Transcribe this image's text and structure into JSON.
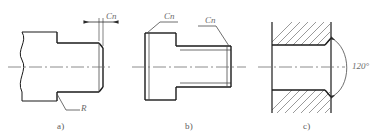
{
  "figure": {
    "background_color": "#ffffff",
    "line_color": "#1a1a1a",
    "thin_line_color": "#4a4a4a",
    "center_line_color": "#6e6e6e",
    "hatch_color": "#6e6e6e",
    "text_color": "#5b5b5b"
  },
  "subfigures": [
    {
      "id": "a",
      "caption": "a)",
      "description": "Shaft end with chamfer and fillet radius, left side broken",
      "labels": [
        {
          "name": "chamfer-dimension",
          "text": "Cn"
        },
        {
          "name": "fillet-radius",
          "text": "R"
        }
      ]
    },
    {
      "id": "b",
      "caption": "b)",
      "description": "Stepped shaft with two chamfer leader labels",
      "labels": [
        {
          "name": "chamfer-dimension-left",
          "text": "Cn"
        },
        {
          "name": "chamfer-dimension-right",
          "text": "Cn"
        }
      ]
    },
    {
      "id": "c",
      "caption": "c)",
      "description": "Sectioned bore with countersink angular dimension",
      "labels": [
        {
          "name": "countersink-angle",
          "text": "120°"
        }
      ]
    }
  ],
  "captions": {
    "a": "a)",
    "b": "b)",
    "c": "c)"
  },
  "annotations": {
    "a_chamfer": "Cn",
    "a_radius": "R",
    "b_chamfer_left": "Cn",
    "b_chamfer_right": "Cn",
    "c_angle": "120°"
  }
}
